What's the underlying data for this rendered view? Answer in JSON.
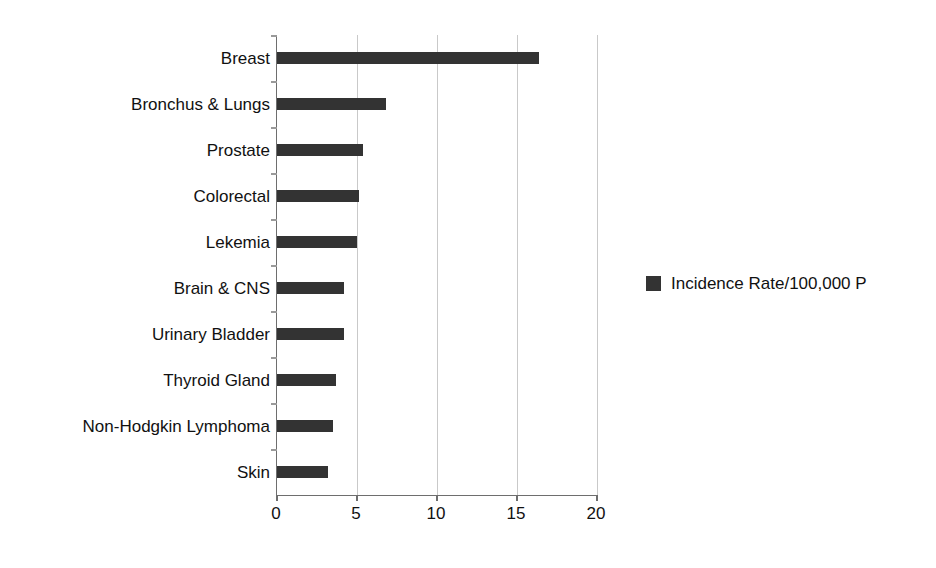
{
  "chart_data": {
    "type": "bar",
    "orientation": "horizontal",
    "title": "",
    "subtitle": "",
    "xlabel": "",
    "ylabel": "",
    "xlim": [
      0,
      20
    ],
    "xticks": [
      "0",
      "5",
      "10",
      "15",
      "20"
    ],
    "xtick_values": [
      0,
      5,
      10,
      15,
      20
    ],
    "grid": "vertical",
    "legend_position": "right",
    "categories": [
      "Breast",
      "Bronchus & Lungs",
      "Prostate",
      "Colorectal",
      "Lekemia",
      "Brain & CNS",
      "Urinary Bladder",
      "Thyroid Gland",
      "Non-Hodgkin Lymphoma",
      "Skin"
    ],
    "series": [
      {
        "name": "Incidence Rate/100,000 P",
        "color": "#333333",
        "values": [
          16.4,
          6.8,
          5.4,
          5.1,
          5.0,
          4.2,
          4.2,
          3.7,
          3.5,
          3.2
        ]
      }
    ]
  },
  "legend": {
    "entries": [
      {
        "label": "Incidence Rate/100,000 P",
        "swatch_color": "#333333"
      }
    ]
  },
  "axis": {
    "gridline_color": "#c9c9c9",
    "axis_line_color": "#6e6e6e"
  }
}
